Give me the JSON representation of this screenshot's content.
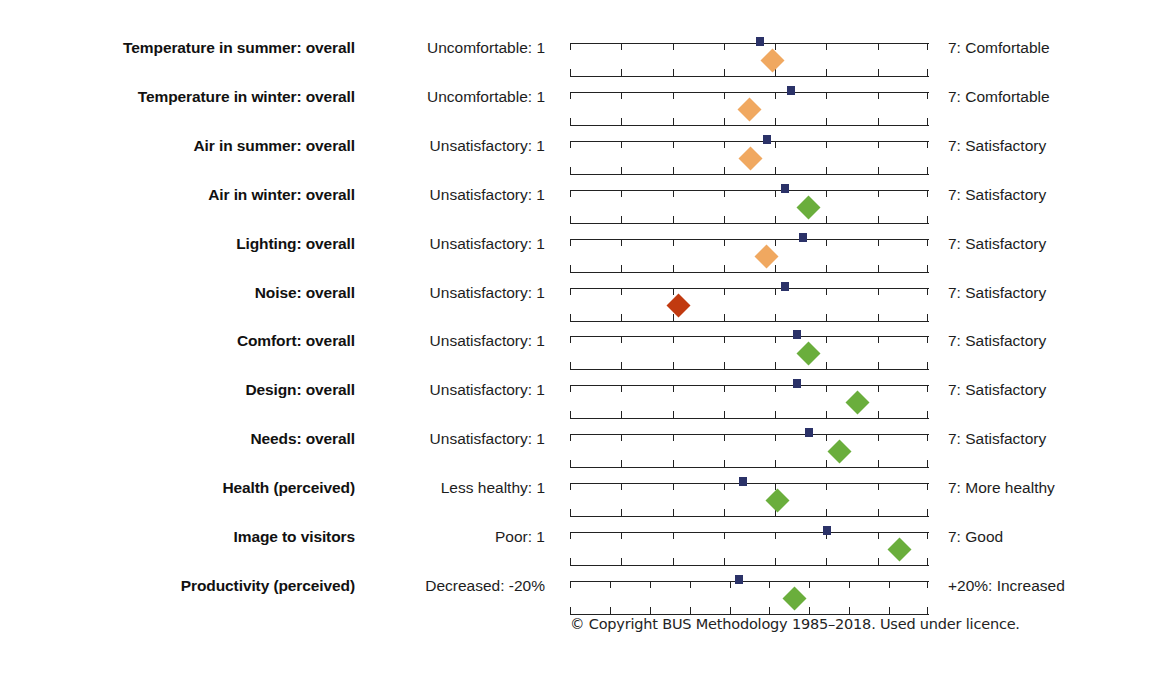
{
  "footer": {
    "copyright": "© Copyright BUS Methodology 1985–2018. Used under licence."
  },
  "colors": {
    "benchmark": "#2b3268",
    "marker_green": "#6aae3c",
    "marker_orange": "#f0a860",
    "marker_red": "#c13a10",
    "axis": "#222222",
    "text": "#1a1a1a"
  },
  "chart_data": {
    "type": "scatter",
    "title": "",
    "subtitle": "",
    "xlabel": "",
    "ylabel": "",
    "grid": false,
    "legend_position": "none",
    "scale_min": 1,
    "scale_max": 7,
    "scale_midpoint": 4,
    "annotations": [
      "Blue square marker = benchmark / scale mean",
      "Diamond marker = surveyed building score"
    ],
    "categories": [
      "Temperature in summer: overall",
      "Temperature in winter: overall",
      "Air in summer: overall",
      "Air in winter: overall",
      "Lighting: overall",
      "Noise: overall",
      "Comfort: overall",
      "Design: overall",
      "Needs: overall",
      "Health (perceived)",
      "Image to visitors",
      "Productivity (perceived)"
    ],
    "rows": [
      {
        "label": "Temperature in summer: overall",
        "low_label": "Uncomfortable: 1",
        "high_label": "7: Comfortable",
        "axis_min": 1,
        "axis_max": 7,
        "ticks": 6,
        "benchmark": 4.17,
        "score": 4.38,
        "marker_color": "#f0a860"
      },
      {
        "label": "Temperature in winter: overall",
        "low_label": "Uncomfortable: 1",
        "high_label": "7: Comfortable",
        "axis_min": 1,
        "axis_max": 7,
        "ticks": 6,
        "benchmark": 4.7,
        "score": 4.0,
        "marker_color": "#f0a860"
      },
      {
        "label": "Air in summer: overall",
        "low_label": "Unsatisfactory: 1",
        "high_label": "7: Satisfactory",
        "axis_min": 1,
        "axis_max": 7,
        "ticks": 6,
        "benchmark": 4.3,
        "score": 4.01,
        "marker_color": "#f0a860"
      },
      {
        "label": "Air in winter: overall",
        "low_label": "Unsatisfactory: 1",
        "high_label": "7: Satisfactory",
        "axis_min": 1,
        "axis_max": 7,
        "ticks": 6,
        "benchmark": 4.59,
        "score": 4.99,
        "marker_color": "#6aae3c"
      },
      {
        "label": "Lighting: overall",
        "low_label": "Unsatisfactory: 1",
        "high_label": "7: Satisfactory",
        "axis_min": 1,
        "axis_max": 7,
        "ticks": 6,
        "benchmark": 4.89,
        "score": 4.28,
        "marker_color": "#f0a860"
      },
      {
        "label": "Noise: overall",
        "low_label": "Unsatisfactory: 1",
        "high_label": "7: Satisfactory",
        "axis_min": 1,
        "axis_max": 7,
        "ticks": 6,
        "benchmark": 4.59,
        "score": 2.82,
        "marker_color": "#c13a10"
      },
      {
        "label": "Comfort: overall",
        "low_label": "Unsatisfactory: 1",
        "high_label": "7: Satisfactory",
        "axis_min": 1,
        "axis_max": 7,
        "ticks": 6,
        "benchmark": 4.79,
        "score": 4.99,
        "marker_color": "#6aae3c"
      },
      {
        "label": "Design: overall",
        "low_label": "Unsatisfactory: 1",
        "high_label": "7: Satisfactory",
        "axis_min": 1,
        "axis_max": 7,
        "ticks": 6,
        "benchmark": 4.79,
        "score": 5.8,
        "marker_color": "#6aae3c"
      },
      {
        "label": "Needs: overall",
        "low_label": "Unsatisfactory: 1",
        "high_label": "7: Satisfactory",
        "axis_min": 1,
        "axis_max": 7,
        "ticks": 6,
        "benchmark": 4.99,
        "score": 5.51,
        "marker_color": "#6aae3c"
      },
      {
        "label": "Health (perceived)",
        "low_label": "Less healthy: 1",
        "high_label": "7: More healthy",
        "axis_min": 1,
        "axis_max": 7,
        "ticks": 6,
        "benchmark": 3.89,
        "score": 4.47,
        "marker_color": "#6aae3c"
      },
      {
        "label": "Image to visitors",
        "low_label": "Poor: 1",
        "high_label": "7: Good",
        "axis_min": 1,
        "axis_max": 7,
        "ticks": 6,
        "benchmark": 5.29,
        "score": 6.51,
        "marker_color": "#6aae3c"
      },
      {
        "label": "Productivity (perceived)",
        "low_label": "Decreased: -20%",
        "high_label": "+20%: Increased",
        "axis_min": -20,
        "axis_max": 20,
        "ticks": 8,
        "benchmark": -1.2,
        "score": 5.0,
        "marker_color": "#6aae3c"
      }
    ]
  }
}
